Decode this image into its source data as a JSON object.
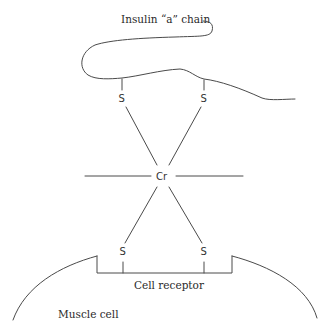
{
  "diagram": {
    "title_label": "Insulin “a” chain",
    "central_atom": "Cr",
    "upper_sulfur_left": "S",
    "upper_sulfur_right": "S",
    "lower_sulfur_left": "S",
    "lower_sulfur_right": "S",
    "receptor_label": "Cell receptor",
    "cell_label": "Muscle cell",
    "line_color": "#4a4a4a"
  }
}
